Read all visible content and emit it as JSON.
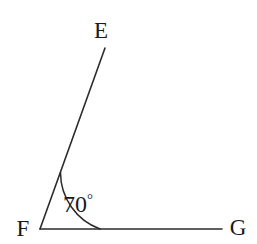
{
  "figure": {
    "kind": "angle-diagram",
    "background_color": "#ffffff",
    "stroke_color": "#2b2b2b",
    "text_color": "#1a1a1a",
    "canvas": {
      "width": 257,
      "height": 244
    }
  },
  "points": {
    "vertex": {
      "name": "F",
      "x": 40,
      "y": 229,
      "label_x": 23,
      "label_y": 236
    },
    "ray_end_upper": {
      "name": "E",
      "x": 105,
      "y": 48,
      "label_x": 101,
      "label_y": 38
    },
    "ray_end_right": {
      "name": "G",
      "x": 222,
      "y": 229,
      "label_x": 238,
      "label_y": 235
    }
  },
  "rays": [
    {
      "name": "ray-FE",
      "from": "F",
      "to": "E",
      "path": "M 40 229 L 105 48"
    },
    {
      "name": "ray-FG",
      "from": "F",
      "to": "G",
      "path": "M 40 229 L 222 229"
    }
  ],
  "angle": {
    "label": "70",
    "degree_symbol": "°",
    "value": 70,
    "unit": "degrees",
    "at_vertex": "F",
    "between_rays": [
      "FE",
      "FG"
    ],
    "arc_radius": 60,
    "arc_path": "M 100 229 A 60 60 0 0 1 60.5 172.6",
    "label_x": 78,
    "label_y": 212
  },
  "chart_data": {
    "type": "diagram",
    "title": "",
    "labels": [
      "E",
      "F",
      "G"
    ],
    "measures": [
      {
        "name": "angle EFG",
        "value": 70,
        "unit": "degrees"
      }
    ]
  }
}
